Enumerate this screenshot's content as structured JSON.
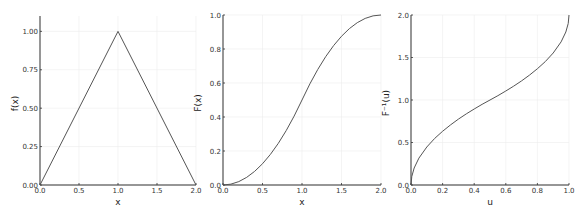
{
  "chart_data": [
    {
      "type": "line",
      "title": "",
      "xlabel": "x",
      "ylabel": "f(x)",
      "xlim": [
        0,
        2
      ],
      "ylim": [
        0,
        1.1
      ],
      "xticks": [
        0.0,
        0.5,
        1.0,
        1.5,
        2.0
      ],
      "xtick_labels": [
        "0.0",
        "0.5",
        "1.0",
        "1.5",
        "2.0"
      ],
      "yticks": [
        0.0,
        0.25,
        0.5,
        0.75,
        1.0
      ],
      "ytick_labels": [
        "0.00",
        "0.25",
        "0.50",
        "0.75",
        "1.00"
      ],
      "grid": true,
      "legend": null,
      "series": [
        {
          "name": "f(x)",
          "x": [
            0,
            1,
            2
          ],
          "y": [
            0,
            1,
            0
          ]
        }
      ]
    },
    {
      "type": "line",
      "title": "",
      "xlabel": "x",
      "ylabel": "F(x)",
      "xlim": [
        0,
        2
      ],
      "ylim": [
        0,
        1.0
      ],
      "xticks": [
        0.0,
        0.5,
        1.0,
        1.5,
        2.0
      ],
      "xtick_labels": [
        "0.0",
        "0.5",
        "1.0",
        "1.5",
        "2.0"
      ],
      "yticks": [
        0.0,
        0.2,
        0.4,
        0.6,
        0.8,
        1.0
      ],
      "ytick_labels": [
        "0.0",
        "0.2",
        "0.4",
        "0.6",
        "0.8",
        "1.0"
      ],
      "grid": true,
      "legend": null,
      "series": [
        {
          "name": "F(x)",
          "x": [
            0,
            0.1,
            0.2,
            0.3,
            0.4,
            0.5,
            0.6,
            0.7,
            0.8,
            0.9,
            1.0,
            1.1,
            1.2,
            1.3,
            1.4,
            1.5,
            1.6,
            1.7,
            1.8,
            1.9,
            2.0
          ],
          "y": [
            0,
            0.005,
            0.02,
            0.045,
            0.08,
            0.125,
            0.18,
            0.245,
            0.32,
            0.405,
            0.5,
            0.595,
            0.68,
            0.755,
            0.82,
            0.875,
            0.92,
            0.955,
            0.98,
            0.995,
            1.0
          ]
        }
      ]
    },
    {
      "type": "line",
      "title": "",
      "xlabel": "u",
      "ylabel": "F⁻¹(u)",
      "xlim": [
        0,
        1
      ],
      "ylim": [
        0,
        2.0
      ],
      "xticks": [
        0.0,
        0.2,
        0.4,
        0.6,
        0.8,
        1.0
      ],
      "xtick_labels": [
        "0.0",
        "0.2",
        "0.4",
        "0.6",
        "0.8",
        "1.0"
      ],
      "yticks": [
        0.0,
        0.5,
        1.0,
        1.5,
        2.0
      ],
      "ytick_labels": [
        "0.0",
        "0.5",
        "1.0",
        "1.5",
        "2.0"
      ],
      "grid": true,
      "legend": null,
      "series": [
        {
          "name": "F^-1(u)",
          "x": [
            0,
            0.005,
            0.02,
            0.05,
            0.1,
            0.15,
            0.2,
            0.25,
            0.3,
            0.35,
            0.4,
            0.45,
            0.5,
            0.55,
            0.6,
            0.65,
            0.7,
            0.75,
            0.8,
            0.85,
            0.9,
            0.95,
            0.98,
            0.995,
            1.0
          ],
          "y": [
            0,
            0.1,
            0.2,
            0.316,
            0.447,
            0.548,
            0.632,
            0.707,
            0.775,
            0.837,
            0.894,
            0.949,
            1.0,
            1.051,
            1.106,
            1.163,
            1.225,
            1.293,
            1.368,
            1.452,
            1.553,
            1.684,
            1.8,
            1.9,
            2.0
          ]
        }
      ]
    }
  ],
  "panels": [
    {
      "xlabel": "x",
      "ylabel": "f(x)"
    },
    {
      "xlabel": "x",
      "ylabel": "F(x)"
    },
    {
      "xlabel": "u",
      "ylabel": "F⁻¹(u)"
    }
  ]
}
